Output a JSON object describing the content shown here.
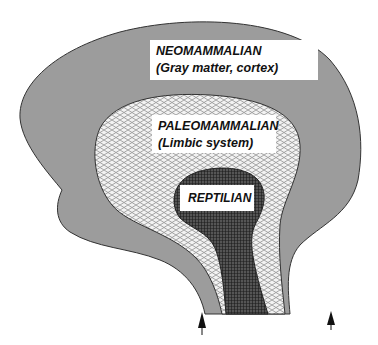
{
  "diagram": {
    "type": "triune-brain",
    "layers": [
      {
        "id": "neomammalian",
        "title": "NEOMAMMALIAN",
        "subtitle": "(Gray matter, cortex)",
        "fill": "#9c9c9c",
        "pattern": "solid-gray"
      },
      {
        "id": "paleomammalian",
        "title": "PALEOMAMMALIAN",
        "subtitle": "(Limbic system)",
        "fill": "#e8e8e8",
        "pattern": "crosshatch-light"
      },
      {
        "id": "reptilian",
        "title": "REPTILIAN",
        "subtitle": "",
        "fill": "#3a3a3a",
        "pattern": "grid-dark"
      }
    ],
    "arrows": [
      {
        "id": "arrow-left",
        "direction": "up"
      },
      {
        "id": "arrow-right",
        "direction": "up"
      }
    ],
    "colors": {
      "outline": "#333333",
      "background": "#ffffff",
      "arrow": "#111111"
    }
  }
}
